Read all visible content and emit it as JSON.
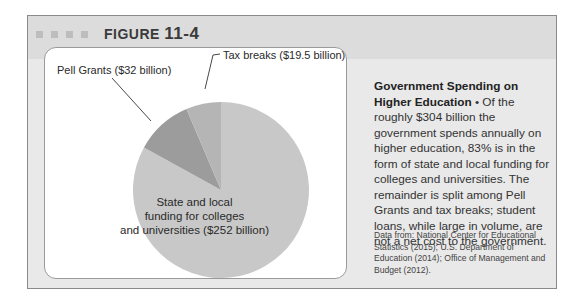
{
  "figure": {
    "label": "FIGURE",
    "number": "11-4"
  },
  "caption": {
    "title": "Government Spending on Higher Education",
    "bullet": " • ",
    "body": "Of the roughly $304 billion the government spends annually on higher education, 83% is in the form of state and local funding for colleges and universities. The remainder is split among Pell Grants and tax breaks; student loans, while large in volume, are not a net cost to the government.",
    "source": "Data from: National Center for Educational Statistics (2015); U.S. Department of Education (2014); Office of Management and Budget (2012)."
  },
  "labels": {
    "pell": "Pell Grants ($32 billion)",
    "tax": "Tax breaks ($19.5 billion)",
    "state_line1": "State and local",
    "state_line2": "funding for colleges",
    "state_line3": "and universities ($252 billion)"
  },
  "colors": {
    "state": "#c8c8c8",
    "pell": "#9c9c9c",
    "tax": "#b5b5b5",
    "frame": "#e9e9e9",
    "header": "#dcdcdc"
  },
  "chart_data": {
    "type": "pie",
    "title": "Government Spending on Higher Education",
    "categories": [
      "State and local funding for colleges and universities",
      "Pell Grants",
      "Tax breaks"
    ],
    "values": [
      252,
      32,
      19.5
    ],
    "units": "billion USD",
    "total_approx": 304,
    "annotations": [
      "State and local funding for colleges and universities ($252 billion)",
      "Pell Grants ($32 billion)",
      "Tax breaks ($19.5 billion)"
    ],
    "legend": "none (direct labels)"
  }
}
